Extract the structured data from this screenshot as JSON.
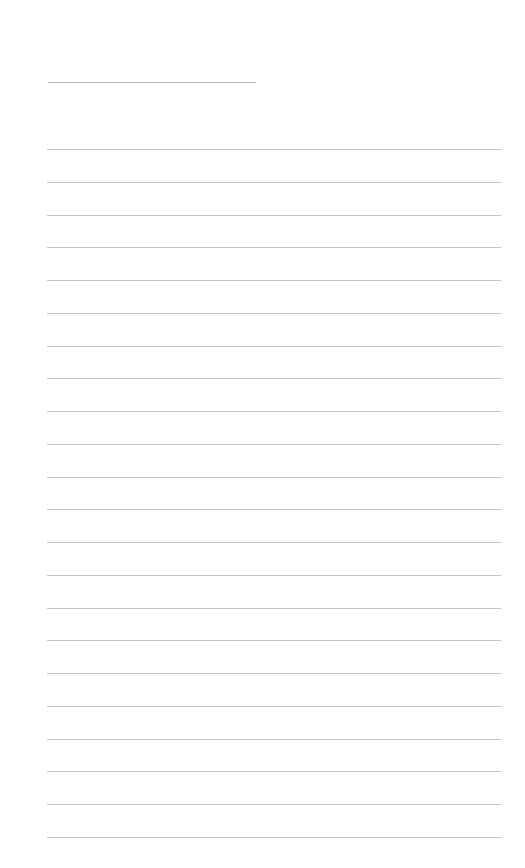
{
  "page": {
    "type": "blank ruled writing sheet",
    "background": "#ffffff",
    "line_color": "#c4c4c4",
    "title_line": {
      "text": ""
    },
    "ruled_lines": {
      "count": 22,
      "entries": [
        "",
        "",
        "",
        "",
        "",
        "",
        "",
        "",
        "",
        "",
        "",
        "",
        "",
        "",
        "",
        "",
        "",
        "",
        "",
        "",
        "",
        ""
      ]
    }
  }
}
